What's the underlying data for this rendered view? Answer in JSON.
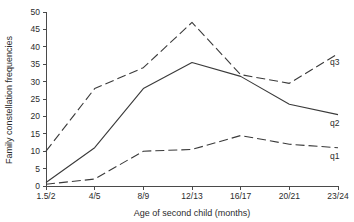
{
  "chart_data": {
    "type": "line",
    "title": "",
    "xlabel": "Age of second child (months)",
    "ylabel": "Family constellation frequencies",
    "categories": [
      "1.5/2",
      "4/5",
      "8/9",
      "12/13",
      "16/17",
      "20/21",
      "23/24"
    ],
    "x": [
      "1.5/2",
      "4/5",
      "8/9",
      "12/13",
      "16/17",
      "20/21",
      "23/24"
    ],
    "ylim": [
      0,
      50
    ],
    "yticks": [
      0,
      5,
      10,
      15,
      20,
      25,
      30,
      35,
      40,
      45,
      50
    ],
    "ytick_labels": [
      "0",
      "5",
      "10",
      "15",
      "20",
      "25",
      "30",
      "35",
      "40",
      "45",
      "50"
    ],
    "grid": false,
    "legend_position": "right-inline-end-of-line",
    "series": [
      {
        "name": "q3",
        "label": "q3",
        "style": "dashed",
        "color": "#3a3a3a",
        "values": [
          10,
          28,
          34,
          47,
          32,
          29.5,
          38
        ]
      },
      {
        "name": "q2",
        "label": "q2",
        "style": "solid",
        "color": "#3a3a3a",
        "values": [
          1,
          11,
          28,
          35.5,
          31.5,
          23.5,
          20.5
        ]
      },
      {
        "name": "q1",
        "label": "q1",
        "style": "dashed",
        "color": "#3a3a3a",
        "values": [
          0.5,
          2,
          10,
          10.5,
          14.5,
          12,
          11
        ]
      }
    ]
  }
}
